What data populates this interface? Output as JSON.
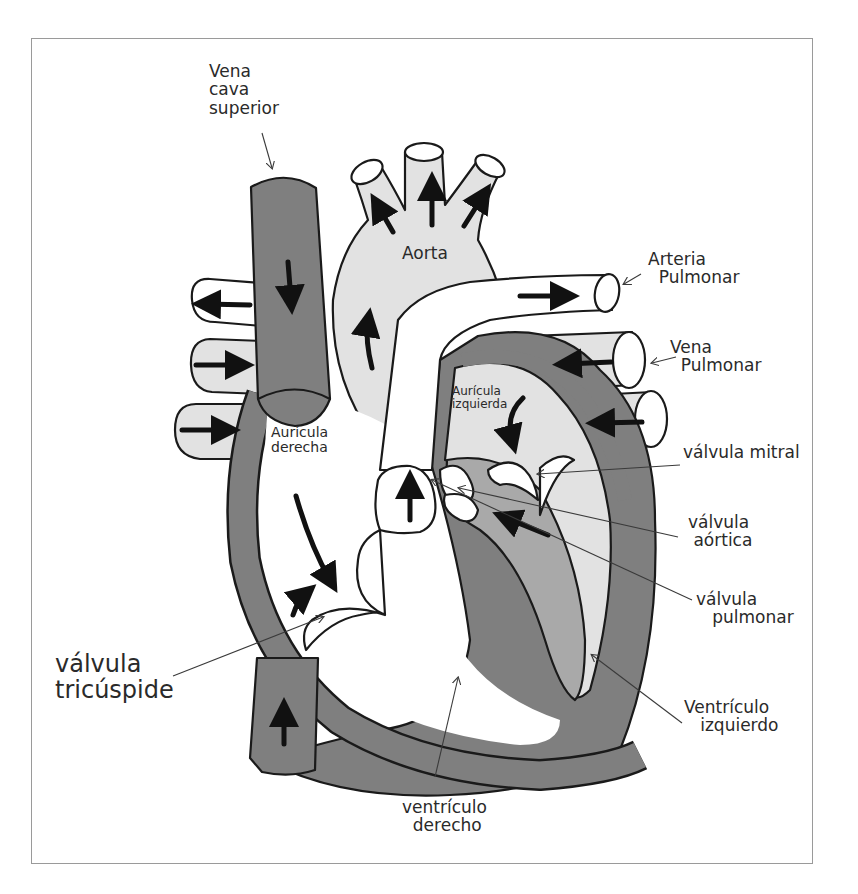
{
  "diagram": {
    "colors": {
      "background": "#ffffff",
      "frame_border": "#9a9a9a",
      "outline": "#1a1a1a",
      "dark_gray_vessels": "#7f7f7f",
      "mid_gray_left_heart": "#a9a9a9",
      "light_gray_arteries": "#e2e2e2",
      "arrow": "#111111",
      "leader_line": "#3a3a3a"
    },
    "labels": {
      "vena_cava_superior": "Vena\ncava\nsuperior",
      "aorta": "Aorta",
      "arteria_pulmonar": "Arteria\n  Pulmonar",
      "vena_pulmonar": "Vena\n  Pulmonar",
      "auricula_izquierda": "Aurícula\nizquierda",
      "auricula_derecha": "Aurícula\nderecha",
      "valvula_mitral": "válvula mitral",
      "valvula_aortica": "válvula\n aórtica",
      "valvula_pulmonar": "válvula\n   pulmonar",
      "valvula_tricuspide": "válvula\ntricúspide",
      "ventriculo_izquierdo": "Ventrículo\n   izquierdo",
      "ventriculo_derecho": "ventrículo\n  derecho"
    },
    "structures": [
      "vena cava superior",
      "vena cava inferior",
      "aorta",
      "arteria pulmonar",
      "venas pulmonares",
      "aurícula derecha",
      "aurícula izquierda",
      "ventrículo derecho",
      "ventrículo izquierdo",
      "válvula tricúspide",
      "válvula pulmonar",
      "válvula aórtica",
      "válvula mitral"
    ]
  }
}
